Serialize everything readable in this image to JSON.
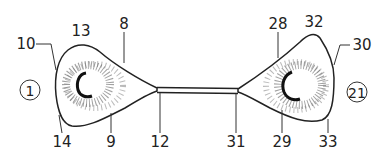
{
  "diagram": {
    "type": "labeled line drawing",
    "colors": {
      "line": "#222222",
      "stipple": "#333333",
      "background": "#ffffff"
    },
    "circled_labels": [
      {
        "text": "1",
        "x": 30,
        "y": 90
      },
      {
        "text": "21",
        "x": 357,
        "y": 92
      }
    ],
    "labels": [
      {
        "text": "10",
        "x": 26,
        "y": 44
      },
      {
        "text": "13",
        "x": 81,
        "y": 31
      },
      {
        "text": "8",
        "x": 124,
        "y": 24
      },
      {
        "text": "14",
        "x": 62,
        "y": 142
      },
      {
        "text": "9",
        "x": 111,
        "y": 142
      },
      {
        "text": "12",
        "x": 160,
        "y": 142
      },
      {
        "text": "28",
        "x": 278,
        "y": 24
      },
      {
        "text": "32",
        "x": 314,
        "y": 22
      },
      {
        "text": "30",
        "x": 360,
        "y": 45
      },
      {
        "text": "31",
        "x": 236,
        "y": 142
      },
      {
        "text": "29",
        "x": 282,
        "y": 142
      },
      {
        "text": "33",
        "x": 328,
        "y": 142
      }
    ]
  }
}
